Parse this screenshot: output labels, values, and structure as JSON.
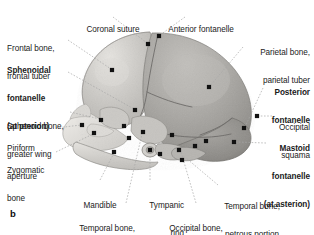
{
  "figure": {
    "panel_label": "b",
    "caption_subject": "neonatal skull, lateral view",
    "background_color": "#ffffff",
    "ink_color": "#1b1b1b"
  },
  "image": {
    "name": "neonatal-skull-lateral-photograph",
    "palette": {
      "calvaria_light": "#cfcdc9",
      "parietal_mid": "#a9a7a3",
      "occipital_dark": "#8e8c88",
      "facial_pale": "#e2e0dc",
      "suture_line": "#6f6d6a",
      "marker_dot": "#111111",
      "leader_line": "#9a9a9a"
    }
  },
  "labels": [
    {
      "id": "coronal-suture",
      "text": "Coronal suture",
      "bold": false
    },
    {
      "id": "anterior-fontanelle",
      "text": "Anterior fontanelle",
      "bold": false
    },
    {
      "id": "frontal-bone",
      "text": "Frontal bone,\nfrontal tuber",
      "bold": false
    },
    {
      "id": "sphenoidal-fontanelle",
      "text": "Sphenoidal\nfontanelle\n(at pterion)",
      "bold": true
    },
    {
      "id": "sphenoid-bone",
      "text": "Sphenoid bone,\ngreater wing",
      "bold": false
    },
    {
      "id": "piriform-aperture",
      "text": "Piriform\naperture",
      "bold": false
    },
    {
      "id": "zygomatic-bone",
      "text": "Zygomatic\nbone",
      "bold": false
    },
    {
      "id": "mandible",
      "text": "Mandible",
      "bold": false
    },
    {
      "id": "tympanic-ring",
      "text": "Tympanic\nring",
      "bold": false
    },
    {
      "id": "temporal-bone-squamous",
      "text": "Temporal bone,\nsquamous part",
      "bold": false
    },
    {
      "id": "occipital-bone-lateral",
      "text": "Occipital bone,\nlateral part",
      "bold": false
    },
    {
      "id": "temporal-bone-petrous",
      "text": "Temporal bone,\npetrous portion",
      "bold": false
    },
    {
      "id": "parietal-bone",
      "text": "Parietal bone,\nparietal tuber",
      "bold": false
    },
    {
      "id": "posterior-fontanelle",
      "text": "Posterior\nfontanelle",
      "bold": true
    },
    {
      "id": "occipital-squama",
      "text": "Occipital\nsquama",
      "bold": false
    },
    {
      "id": "mastoid-fontanelle",
      "text": "Mastoid\nfontanelle\n(at asterion)",
      "bold": true
    }
  ],
  "label_lines": {
    "coronal-suture": {
      "l1": "Coronal suture"
    },
    "anterior-fontanelle": {
      "l1": "Anterior fontanelle"
    },
    "frontal-bone": {
      "l1": "Frontal bone,",
      "l2": "frontal tuber"
    },
    "sphenoidal-fontanelle": {
      "l1": "Sphenoidal",
      "l2": "fontanelle",
      "l3": "(at pterion)"
    },
    "sphenoid-bone": {
      "l1": "Sphenoid bone,",
      "l2": "greater wing"
    },
    "piriform-aperture": {
      "l1": "Piriform",
      "l2": "aperture"
    },
    "zygomatic-bone": {
      "l1": "Zygomatic",
      "l2": "bone"
    },
    "mandible": {
      "l1": "Mandible"
    },
    "tympanic-ring": {
      "l1": "Tympanic",
      "l2": "ring"
    },
    "temporal-bone-squamous": {
      "l1": "Temporal bone,",
      "l2": "squamous part"
    },
    "occipital-bone-lateral": {
      "l1": "Occipital bone,",
      "l2": "lateral part"
    },
    "temporal-bone-petrous": {
      "l1": "Temporal bone,",
      "l2": "petrous portion"
    },
    "parietal-bone": {
      "l1": "Parietal bone,",
      "l2": "parietal tuber"
    },
    "posterior-fontanelle": {
      "l1": "Posterior",
      "l2": "fontanelle"
    },
    "occipital-squama": {
      "l1": "Occipital",
      "l2": "squama"
    },
    "mastoid-fontanelle": {
      "l1": "Mastoid",
      "l2": "fontanelle",
      "l3": "(at asterion)"
    }
  },
  "markers": [
    {
      "id": "marker-coronal-suture",
      "x": 148,
      "y": 44
    },
    {
      "id": "marker-anterior-fontanelle",
      "x": 159,
      "y": 36
    },
    {
      "id": "marker-frontal-tuber",
      "x": 112,
      "y": 70
    },
    {
      "id": "marker-parietal-tuber",
      "x": 209,
      "y": 87
    },
    {
      "id": "marker-posterior-fontanelle",
      "x": 244,
      "y": 128
    },
    {
      "id": "marker-occipital-squama",
      "x": 257,
      "y": 116
    },
    {
      "id": "marker-mastoid-fontanelle",
      "x": 234,
      "y": 142
    },
    {
      "id": "marker-sphenoidal-fontanelle",
      "x": 135,
      "y": 110
    },
    {
      "id": "marker-sphenoid-greater-wing",
      "x": 101,
      "y": 120
    },
    {
      "id": "marker-piriform-aperture",
      "x": 82,
      "y": 125
    },
    {
      "id": "marker-zygomatic-bone",
      "x": 94,
      "y": 133
    },
    {
      "id": "marker-mandible",
      "x": 114,
      "y": 152
    },
    {
      "id": "marker-tympanic-ring",
      "x": 150,
      "y": 150
    },
    {
      "id": "marker-temporal-squamous",
      "x": 143,
      "y": 132
    },
    {
      "id": "marker-temporal-petrous",
      "x": 160,
      "y": 154
    },
    {
      "id": "marker-occipital-lateral",
      "x": 179,
      "y": 150
    },
    {
      "id": "marker-occipital-lateral-2",
      "x": 195,
      "y": 146
    },
    {
      "id": "marker-extra-parietal",
      "x": 172,
      "y": 135
    },
    {
      "id": "marker-extra-occipital",
      "x": 206,
      "y": 141
    },
    {
      "id": "marker-extra-temporal",
      "x": 129,
      "y": 138
    },
    {
      "id": "marker-extra-face",
      "x": 124,
      "y": 126
    },
    {
      "id": "marker-extra-mastoid",
      "x": 182,
      "y": 160
    }
  ]
}
